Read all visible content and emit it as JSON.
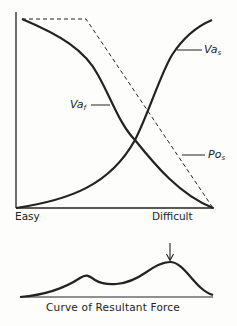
{
  "diagram": {
    "main_chart": {
      "x_axis": {
        "left_label": "Easy",
        "right_label": "Difficult"
      },
      "curves": [
        {
          "id": "va_f",
          "label_main": "Va",
          "label_sub": "f",
          "style": "solid",
          "trend": "decreasing"
        },
        {
          "id": "va_s",
          "label_main": "Va",
          "label_sub": "s",
          "style": "solid",
          "trend": "increasing"
        },
        {
          "id": "po_s",
          "label_main": "Po",
          "label_sub": "s",
          "style": "dashed",
          "trend": "flat-then-decreasing"
        }
      ]
    },
    "resultant_chart": {
      "caption": "Curve of Resultant Force",
      "marker": "down-arrow-at-peak"
    },
    "colors": {
      "ink": "#222222",
      "background": "#fdfdfc"
    }
  }
}
